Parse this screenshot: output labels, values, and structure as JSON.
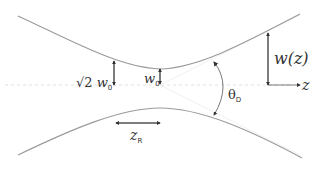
{
  "diagram": {
    "labels": {
      "sqrt2_w0": {
        "prefix": "√2 ",
        "var": "w",
        "sub": "0"
      },
      "w0": {
        "var": "w",
        "sub": "0"
      },
      "wz": "w(z)",
      "theta": {
        "var": "θ",
        "sub": "D"
      },
      "axis": "z",
      "zr": {
        "var": "z",
        "sub": "R"
      }
    },
    "colors": {
      "curve": "#9a9a9a",
      "arrows": "#333333",
      "axis": "#d8d8d8",
      "text": "#333333"
    }
  }
}
